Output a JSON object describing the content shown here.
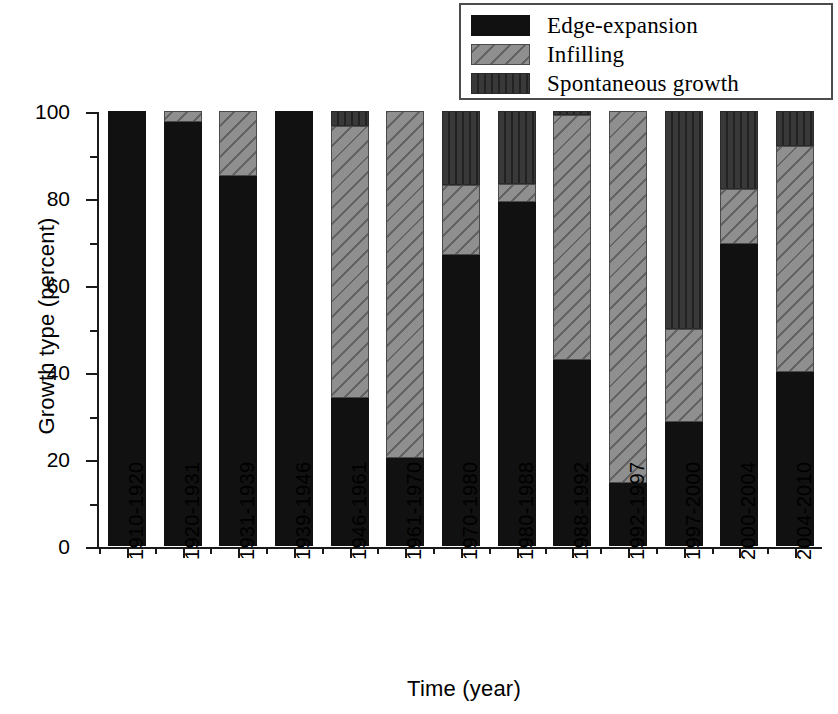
{
  "chart_data": {
    "type": "bar",
    "subtype": "stacked-bar-100-percent",
    "title": "",
    "xlabel": "Time (year)",
    "ylabel": "Growth type (percent)",
    "ylim": [
      0,
      100
    ],
    "yticks": [
      0,
      20,
      40,
      60,
      80,
      100
    ],
    "ytick_labels": [
      "0",
      "20",
      "40",
      "60",
      "80",
      "100"
    ],
    "yminor_ticks": [
      10,
      30,
      50,
      70,
      90
    ],
    "grid": false,
    "legend_position": "top-right",
    "categories": [
      "1910-1920",
      "1920-1931",
      "1931-1939",
      "1939-1946",
      "1946-1961",
      "1961-1970",
      "1970-1980",
      "1980-1988",
      "1988-1992",
      "1992-1997",
      "1997-2000",
      "2000-2004",
      "2004-2010"
    ],
    "series": [
      {
        "name": "Edge-expansion",
        "fill": "solid",
        "color": "#111111",
        "values": [
          100,
          97.5,
          85,
          100,
          34,
          20.3,
          67,
          79,
          42.7,
          14.5,
          28.5,
          69.5,
          40
        ]
      },
      {
        "name": "Infilling",
        "fill": "diagonal-hatch",
        "color": "#8f8f8f",
        "values": [
          0,
          2.5,
          15,
          0,
          62.5,
          79.7,
          16,
          4.3,
          56.3,
          85.5,
          21.5,
          12.5,
          52
        ]
      },
      {
        "name": "Spontaneous growth",
        "fill": "vertical-hatch",
        "color": "#393939",
        "values": [
          0,
          0,
          0,
          0,
          3.5,
          0,
          17,
          16.7,
          1,
          0,
          50,
          18,
          8
        ]
      }
    ]
  },
  "legend": {
    "items": [
      {
        "label": "Edge-expansion"
      },
      {
        "label": "Infilling"
      },
      {
        "label": "Spontaneous growth"
      }
    ]
  }
}
